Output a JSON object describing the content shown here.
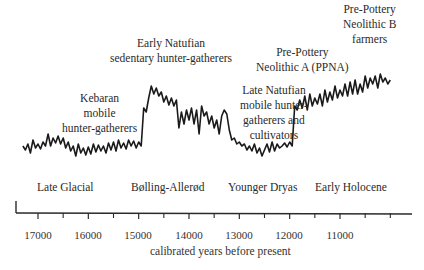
{
  "chart_data": {
    "type": "line",
    "title": "",
    "xlabel": "calibrated years before present",
    "ylabel": "",
    "x_reversed": true,
    "xlim": [
      17450,
      9950
    ],
    "x_ticks": [
      17000,
      16000,
      15000,
      14000,
      13000,
      12000,
      11000
    ],
    "x_tick_labels": [
      "17000",
      "16000",
      "15000",
      "14000",
      "13000",
      "12000",
      "11000"
    ],
    "minor_ticks": [
      16500,
      15500,
      14500,
      13500,
      12500,
      11500,
      10500,
      10000
    ],
    "grid": false,
    "legend": null,
    "y_axis_unlabeled": true,
    "series": [
      {
        "name": "climate proxy (relative)",
        "x": [
          17300,
          17250,
          17200,
          17150,
          17100,
          17050,
          17000,
          16950,
          16900,
          16850,
          16800,
          16750,
          16700,
          16650,
          16600,
          16550,
          16500,
          16450,
          16400,
          16350,
          16300,
          16250,
          16200,
          16150,
          16100,
          16050,
          16000,
          15950,
          15900,
          15850,
          15800,
          15750,
          15700,
          15650,
          15600,
          15550,
          15500,
          15450,
          15400,
          15350,
          15300,
          15250,
          15200,
          15150,
          15100,
          15050,
          15000,
          14950,
          14900,
          14850,
          14800,
          14750,
          14700,
          14650,
          14600,
          14550,
          14500,
          14450,
          14400,
          14350,
          14300,
          14250,
          14200,
          14150,
          14100,
          14050,
          14000,
          13950,
          13900,
          13850,
          13800,
          13750,
          13700,
          13650,
          13600,
          13550,
          13500,
          13450,
          13400,
          13350,
          13300,
          13250,
          13200,
          13150,
          13100,
          13050,
          13000,
          12950,
          12900,
          12850,
          12800,
          12750,
          12700,
          12650,
          12600,
          12550,
          12500,
          12450,
          12400,
          12350,
          12300,
          12250,
          12200,
          12150,
          12100,
          12050,
          12000,
          11950,
          11900,
          11850,
          11800,
          11750,
          11700,
          11650,
          11600,
          11550,
          11500,
          11450,
          11400,
          11350,
          11300,
          11250,
          11200,
          11150,
          11100,
          11050,
          11000,
          10950,
          10900,
          10850,
          10800,
          10750,
          10700,
          10650,
          10600,
          10550,
          10500,
          10450,
          10400,
          10350,
          10300,
          10250,
          10200,
          10150,
          10100,
          10050,
          10000
        ],
        "values": [
          22,
          18,
          24,
          15,
          28,
          20,
          24,
          19,
          26,
          22,
          34,
          22,
          30,
          25,
          32,
          24,
          30,
          20,
          26,
          17,
          22,
          12,
          24,
          15,
          20,
          13,
          21,
          14,
          24,
          16,
          23,
          17,
          22,
          15,
          25,
          18,
          26,
          17,
          28,
          20,
          25,
          19,
          28,
          22,
          27,
          20,
          26,
          22,
          60,
          56,
          70,
          82,
          74,
          80,
          72,
          76,
          66,
          72,
          63,
          70,
          62,
          68,
          40,
          56,
          44,
          58,
          48,
          60,
          44,
          58,
          34,
          62,
          52,
          56,
          44,
          52,
          40,
          48,
          34,
          52,
          58,
          54,
          38,
          28,
          30,
          24,
          26,
          22,
          24,
          18,
          22,
          17,
          24,
          15,
          20,
          12,
          18,
          24,
          16,
          26,
          17,
          24,
          20,
          22,
          25,
          21,
          26,
          22,
          62,
          58,
          68,
          60,
          72,
          58,
          74,
          62,
          70,
          64,
          74,
          62,
          78,
          66,
          76,
          68,
          82,
          70,
          78,
          72,
          84,
          72,
          86,
          74,
          88,
          74,
          84,
          76,
          92,
          80,
          90,
          84,
          92,
          80,
          94,
          86,
          90,
          84,
          88
        ],
        "y_range": [
          0,
          100
        ]
      }
    ],
    "annotations": [
      {
        "text": [
          "Kebaran",
          "mobile",
          "hunter-gatherers"
        ],
        "position": "above",
        "x_center": 16400
      },
      {
        "text": [
          "Early Natufian",
          "sedentary hunter-gatherers"
        ],
        "position": "above",
        "x_center": 14200
      },
      {
        "text": [
          "Late Natufian",
          "mobile hunter-",
          "gatherers and",
          "cultivators"
        ],
        "position": "above",
        "x_center": 12200
      },
      {
        "text": [
          "Pre-Pottery",
          "Neolithic A (PPNA)"
        ],
        "position": "above",
        "x_center": 11850
      },
      {
        "text": [
          "Pre-Pottery",
          "Neolithic B",
          "farmers"
        ],
        "position": "above",
        "x_center": 10600
      },
      {
        "text": [
          "Late Glacial"
        ],
        "position": "below",
        "x_center": 16300
      },
      {
        "text": [
          "Bølling-Allerød"
        ],
        "position": "below",
        "x_center": 14600
      },
      {
        "text": [
          "Younger Dryas"
        ],
        "position": "below",
        "x_center": 12850
      },
      {
        "text": [
          "Early Holocene"
        ],
        "position": "below",
        "x_center": 11300
      }
    ]
  },
  "labels": {
    "kebaran": [
      "Kebaran",
      "mobile",
      "hunter-gatherers"
    ],
    "early_natufian": [
      "Early Natufian",
      "sedentary hunter-gatherers"
    ],
    "late_natufian": [
      "Late Natufian",
      "mobile hunter-",
      "gatherers and",
      "cultivators"
    ],
    "ppna": [
      "Pre-Pottery",
      "Neolithic A (PPNA)"
    ],
    "ppnb": [
      "Pre-Pottery",
      "Neolithic B",
      "farmers"
    ],
    "late_glacial": "Late Glacial",
    "bolling_allerod": "Bølling-Allerød",
    "younger_dryas": "Younger Dryas",
    "early_holocene": "Early Holocene"
  },
  "axis": {
    "xlabel": "calibrated years before present",
    "ticks": [
      "17000",
      "16000",
      "15000",
      "14000",
      "13000",
      "12000",
      "11000"
    ]
  },
  "colors": {
    "line": "#1a1a1a",
    "axis": "#2a2a2a",
    "text": "#2a2a2a"
  }
}
